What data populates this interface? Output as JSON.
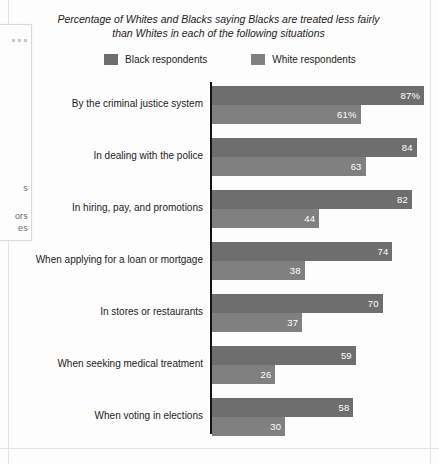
{
  "chart_data": {
    "type": "bar",
    "orientation": "horizontal",
    "title": "Percentage of Whites and Blacks saying Blacks are treated less fairly than Whites in each of the following situations",
    "xlabel": "",
    "ylabel": "",
    "xlim": [
      0,
      100
    ],
    "grid": false,
    "legend_position": "top-center",
    "categories": [
      "By the criminal justice system",
      "In dealing with the police",
      "In hiring, pay, and promotions",
      "When applying for a loan or mortgage",
      "In stores or restaurants",
      "When seeking medical treatment",
      "When voting in elections"
    ],
    "series": [
      {
        "name": "Black respondents",
        "color": "#6e6e6e",
        "values": [
          87,
          84,
          82,
          74,
          70,
          59,
          58
        ],
        "labels": [
          "87%",
          "84",
          "82",
          "74",
          "70",
          "59",
          "58"
        ]
      },
      {
        "name": "White respondents",
        "color": "#808080",
        "values": [
          61,
          63,
          44,
          38,
          37,
          26,
          30
        ],
        "labels": [
          "61%",
          "63",
          "44",
          "38",
          "37",
          "26",
          "30"
        ]
      }
    ]
  },
  "legend": {
    "items": [
      {
        "label": "Black respondents",
        "color": "#6e6e6e"
      },
      {
        "label": "White respondents",
        "color": "#808080"
      }
    ]
  },
  "background_page": {
    "fragments": [
      {
        "text": "s",
        "top": 158
      },
      {
        "text": "ors",
        "top": 186
      },
      {
        "text": "es",
        "top": 198
      }
    ]
  }
}
